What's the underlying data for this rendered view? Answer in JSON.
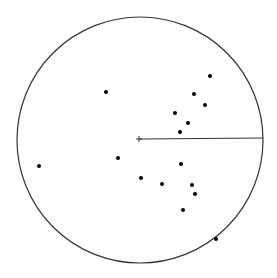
{
  "diagram": {
    "type": "polar-plot",
    "background": "#ffffff",
    "stroke_color": "#333333",
    "point_color": "#000000",
    "circle": {
      "cx": 140,
      "cy": 140,
      "r": 123
    },
    "center_marker": {
      "x": 139,
      "y": 139,
      "size": 3
    },
    "reference_line": {
      "x1": 139,
      "y1": 139,
      "x2": 263,
      "y2": 138
    },
    "points": [
      {
        "x": 106,
        "y": 92
      },
      {
        "x": 210,
        "y": 76
      },
      {
        "x": 194,
        "y": 94
      },
      {
        "x": 205,
        "y": 105
      },
      {
        "x": 175,
        "y": 113
      },
      {
        "x": 188,
        "y": 123
      },
      {
        "x": 180,
        "y": 132
      },
      {
        "x": 118,
        "y": 158
      },
      {
        "x": 39,
        "y": 166
      },
      {
        "x": 181,
        "y": 164
      },
      {
        "x": 141,
        "y": 178
      },
      {
        "x": 162,
        "y": 184
      },
      {
        "x": 192,
        "y": 185
      },
      {
        "x": 195,
        "y": 194
      },
      {
        "x": 183,
        "y": 210
      },
      {
        "x": 216,
        "y": 239
      }
    ]
  }
}
